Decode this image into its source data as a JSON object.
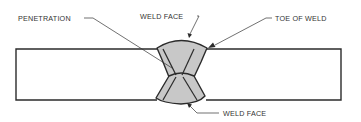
{
  "diagram": {
    "type": "butt-weld cross-section",
    "colors": {
      "line": "#2b2b2b",
      "weld_fill": "#c8c8c8",
      "background": "#ffffff",
      "label_text": "#333333"
    },
    "labels": {
      "penetration": "PENETRATION",
      "weld_face_top": "WELD FACE",
      "toe_of_weld": "TOE OF WELD",
      "weld_face_bottom": "WELD FACE"
    }
  }
}
